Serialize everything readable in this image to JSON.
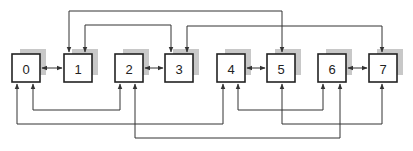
{
  "diagram": {
    "type": "interconnection-network",
    "nodes": [
      {
        "id": "0",
        "label": "0",
        "x": 12
      },
      {
        "id": "1",
        "label": "1",
        "x": 64
      },
      {
        "id": "2",
        "label": "2",
        "x": 115
      },
      {
        "id": "3",
        "label": "3",
        "x": 165
      },
      {
        "id": "4",
        "label": "4",
        "x": 217
      },
      {
        "id": "5",
        "label": "5",
        "x": 267
      },
      {
        "id": "6",
        "label": "6",
        "x": 318
      },
      {
        "id": "7",
        "label": "7",
        "x": 369
      }
    ],
    "edges": [
      {
        "from": "0",
        "to": "1",
        "route": "direct"
      },
      {
        "from": "2",
        "to": "3",
        "route": "direct"
      },
      {
        "from": "4",
        "to": "5",
        "route": "direct"
      },
      {
        "from": "6",
        "to": "7",
        "route": "direct"
      },
      {
        "from": "1",
        "to": "5",
        "route": "top"
      },
      {
        "from": "1",
        "to": "3",
        "route": "top"
      },
      {
        "from": "3",
        "to": "7",
        "route": "top"
      },
      {
        "from": "0",
        "to": "2",
        "route": "bottom"
      },
      {
        "from": "4",
        "to": "6",
        "route": "bottom"
      },
      {
        "from": "0",
        "to": "4",
        "route": "bottom"
      },
      {
        "from": "5",
        "to": "7",
        "route": "bottom"
      },
      {
        "from": "2",
        "to": "6",
        "route": "bottom"
      }
    ],
    "colors": {
      "box_stroke": "#222222",
      "box_fill": "#ffffff",
      "shadow": "#c8c8c8",
      "line": "#333333"
    }
  }
}
